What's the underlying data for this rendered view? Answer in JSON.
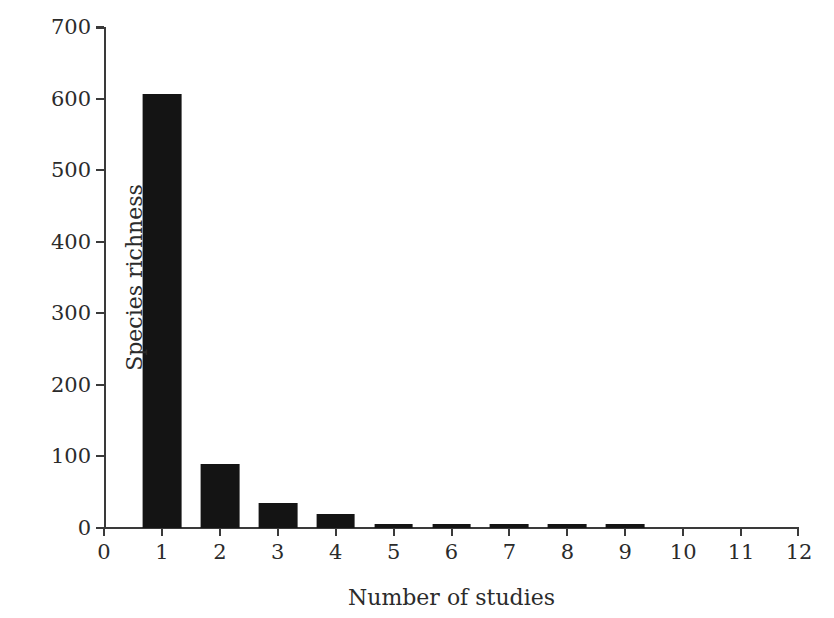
{
  "chart_data": {
    "type": "bar",
    "title": "",
    "xlabel": "Number of studies",
    "ylabel": "Species richness",
    "categories": [
      1,
      2,
      3,
      4,
      5,
      6,
      7,
      8,
      9
    ],
    "values": [
      607,
      90,
      35,
      20,
      6,
      5,
      5,
      5,
      6
    ],
    "series": [
      {
        "name": "Species richness",
        "values": [
          607,
          90,
          35,
          20,
          6,
          5,
          5,
          5,
          6
        ]
      }
    ],
    "xlim": [
      0,
      12
    ],
    "ylim": [
      0,
      700
    ],
    "x_ticks": [
      0,
      1,
      2,
      3,
      4,
      5,
      6,
      7,
      8,
      9,
      10,
      11,
      12
    ],
    "y_ticks": [
      0,
      100,
      200,
      300,
      400,
      500,
      600,
      700
    ],
    "x_tick_labels": [
      "0",
      "1",
      "2",
      "3",
      "4",
      "5",
      "6",
      "7",
      "8",
      "9",
      "10",
      "11",
      "12"
    ],
    "y_tick_labels": [
      "0",
      "100",
      "200",
      "300",
      "400",
      "500",
      "600",
      "700"
    ],
    "grid": false,
    "legend": null,
    "bar_width_units": 0.67,
    "colors": {
      "bar": "#141414",
      "axis": "#3a3a3a",
      "text": "#2b2b2b",
      "background": "#ffffff"
    }
  }
}
